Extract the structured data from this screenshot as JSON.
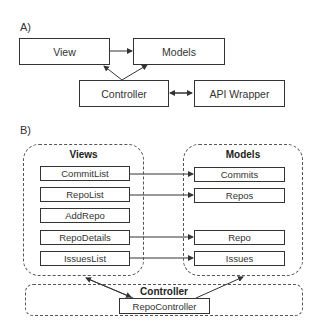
{
  "section_a": {
    "label": "A)",
    "boxes": {
      "view": "View",
      "models": "Models",
      "controller": "Controller",
      "api_wrapper": "API Wrapper"
    },
    "connections": [
      {
        "from": "View",
        "to": "Models",
        "type": "arrow"
      },
      {
        "from": "Controller",
        "to": "View",
        "type": "arrow"
      },
      {
        "from": "Controller",
        "to": "Models",
        "type": "arrow"
      },
      {
        "from": "Controller",
        "to": "API Wrapper",
        "type": "bidirectional"
      }
    ]
  },
  "section_b": {
    "label": "B)",
    "views": {
      "title": "Views",
      "items": [
        "CommitList",
        "RepoList",
        "AddRepo",
        "RepoDetails",
        "IssuesList"
      ]
    },
    "models": {
      "title": "Models",
      "items": [
        "Commits",
        "Repos",
        "Repo",
        "Issues"
      ]
    },
    "controller": {
      "title": "Controller",
      "items": [
        "RepoController"
      ]
    },
    "connections": [
      {
        "from": "CommitList",
        "to": "Commits"
      },
      {
        "from": "RepoList",
        "to": "Repos"
      },
      {
        "from": "RepoDetails",
        "to": "Repo"
      },
      {
        "from": "IssuesList",
        "to": "Issues"
      },
      {
        "from": "RepoController",
        "to": "Views",
        "type": "bidirectional"
      },
      {
        "from": "RepoController",
        "to": "Models",
        "type": "arrow"
      }
    ]
  }
}
